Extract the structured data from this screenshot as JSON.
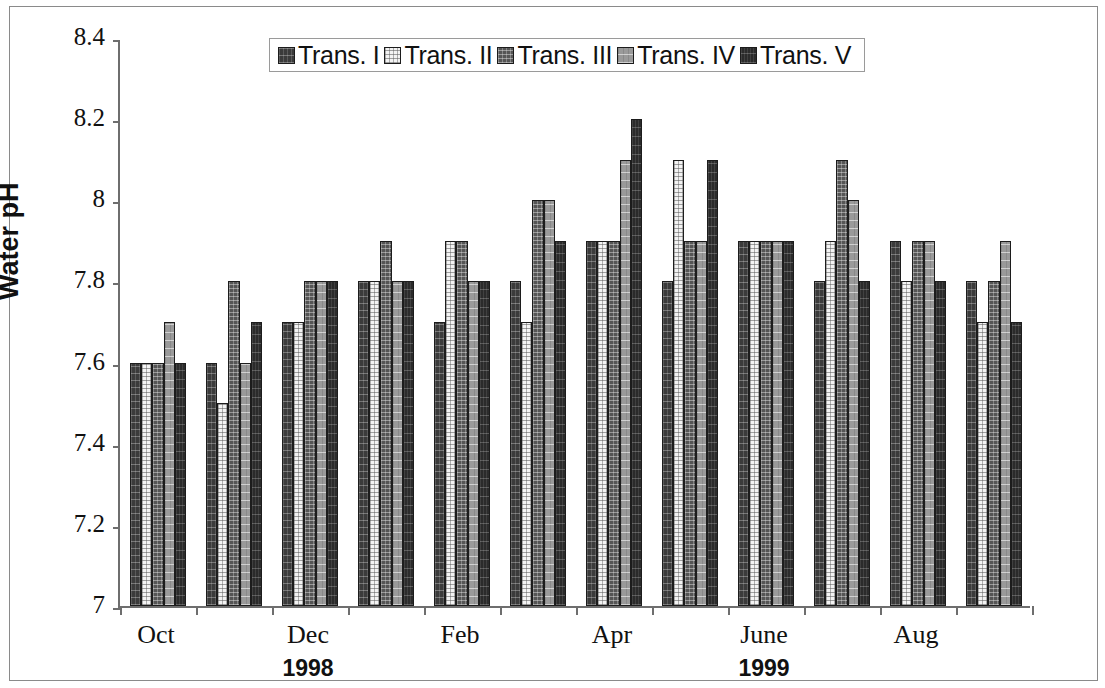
{
  "chart_data": {
    "type": "bar",
    "title": "",
    "subtitle": "",
    "xlabel": "",
    "ylabel": "Water pH",
    "ylim": [
      7,
      8.4
    ],
    "ytick_labels": [
      "8.4",
      "8.2",
      "8",
      "7.8",
      "7.6",
      "7.4",
      "7.2",
      "7"
    ],
    "ytick_values": [
      8.4,
      8.2,
      8.0,
      7.8,
      7.6,
      7.4,
      7.2,
      7.0
    ],
    "grid": false,
    "legend_position": "top-center",
    "categories": [
      "Oct",
      "Nov",
      "Dec",
      "Jan",
      "Feb",
      "Mar",
      "Apr",
      "May",
      "June",
      "July",
      "Aug",
      "Sep"
    ],
    "visible_category_labels": [
      {
        "label": "Oct",
        "index": 0
      },
      {
        "label": "Dec",
        "index": 2
      },
      {
        "label": "Feb",
        "index": 4
      },
      {
        "label": "Apr",
        "index": 6
      },
      {
        "label": "June",
        "index": 8
      },
      {
        "label": "Aug",
        "index": 10
      }
    ],
    "year_groups": [
      {
        "label": "1998",
        "center_index": 2
      },
      {
        "label": "1999",
        "center_index": 8
      }
    ],
    "series": [
      {
        "name": "Trans. I",
        "swatch": "#3b3b3b",
        "values": [
          7.6,
          7.6,
          7.7,
          7.8,
          7.7,
          7.8,
          7.9,
          7.8,
          7.9,
          7.8,
          7.9,
          7.8
        ]
      },
      {
        "name": "Trans. II",
        "swatch": "#f3f3f3",
        "values": [
          7.6,
          7.5,
          7.7,
          7.8,
          7.9,
          7.7,
          7.9,
          8.1,
          7.9,
          7.9,
          7.8,
          7.7
        ]
      },
      {
        "name": "Trans. III",
        "swatch": "#555555",
        "values": [
          7.6,
          7.8,
          7.8,
          7.9,
          7.9,
          8.0,
          7.9,
          7.9,
          7.9,
          8.1,
          7.9,
          7.8
        ]
      },
      {
        "name": "Trans. IV",
        "swatch": "#9a9a9a",
        "values": [
          7.7,
          7.6,
          7.8,
          7.8,
          7.8,
          8.0,
          8.1,
          7.9,
          7.9,
          8.0,
          7.9,
          7.9
        ]
      },
      {
        "name": "Trans. V",
        "swatch": "#2b2b2b",
        "values": [
          7.6,
          7.7,
          7.8,
          7.8,
          7.8,
          7.9,
          8.2,
          8.1,
          7.9,
          7.8,
          7.8,
          7.7
        ]
      }
    ]
  }
}
